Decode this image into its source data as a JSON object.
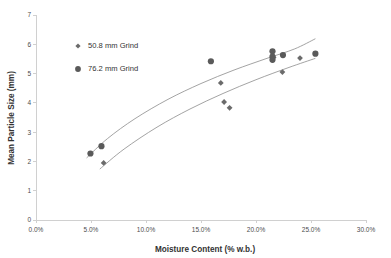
{
  "chart_data": {
    "type": "scatter",
    "title": "",
    "xlabel": "Moisture Content (% w.b.)",
    "ylabel": "Mean Particle Size (mm)",
    "xlim": [
      0,
      30
    ],
    "ylim": [
      0,
      7
    ],
    "xtick_labels": [
      "0.0%",
      "5.0%",
      "10.0%",
      "15.0%",
      "20.0%",
      "25.0%",
      "30.0%"
    ],
    "xtick_values": [
      0,
      5,
      10,
      15,
      20,
      25,
      30
    ],
    "ytick_labels": [
      "0",
      "1",
      "2",
      "3",
      "4",
      "5",
      "6",
      "7"
    ],
    "ytick_values": [
      0,
      1,
      2,
      3,
      4,
      5,
      6,
      7
    ],
    "grid": false,
    "legend_position": "upper-left",
    "marker_color": "#5a5a5a",
    "trendline_color": "#8c8c8c",
    "axis_color": "#d0d0d0",
    "series": [
      {
        "name": "50.8 mm Grind",
        "marker": "diamond",
        "points": [
          {
            "x": 6.15,
            "y": 1.95
          },
          {
            "x": 16.8,
            "y": 4.68
          },
          {
            "x": 17.1,
            "y": 4.03
          },
          {
            "x": 17.6,
            "y": 3.83
          },
          {
            "x": 21.6,
            "y": 5.55
          },
          {
            "x": 22.4,
            "y": 5.05
          },
          {
            "x": 24.0,
            "y": 5.53
          }
        ],
        "trendline": [
          {
            "x": 5.8,
            "y": 1.74
          },
          {
            "x": 8.0,
            "y": 2.42
          },
          {
            "x": 11.0,
            "y": 3.17
          },
          {
            "x": 14.0,
            "y": 3.79
          },
          {
            "x": 17.0,
            "y": 4.32
          },
          {
            "x": 20.0,
            "y": 4.79
          },
          {
            "x": 23.0,
            "y": 5.21
          },
          {
            "x": 25.4,
            "y": 5.52
          }
        ]
      },
      {
        "name": "76.2 mm Grind",
        "marker": "circle",
        "points": [
          {
            "x": 4.95,
            "y": 2.27
          },
          {
            "x": 5.95,
            "y": 2.52
          },
          {
            "x": 15.9,
            "y": 5.42
          },
          {
            "x": 21.5,
            "y": 5.76
          },
          {
            "x": 21.5,
            "y": 5.58
          },
          {
            "x": 21.5,
            "y": 5.47
          },
          {
            "x": 22.45,
            "y": 5.63
          },
          {
            "x": 25.4,
            "y": 5.68
          }
        ],
        "trendline": [
          {
            "x": 4.6,
            "y": 2.12
          },
          {
            "x": 6.5,
            "y": 2.78
          },
          {
            "x": 9.0,
            "y": 3.46
          },
          {
            "x": 12.0,
            "y": 4.12
          },
          {
            "x": 15.0,
            "y": 4.66
          },
          {
            "x": 18.0,
            "y": 5.12
          },
          {
            "x": 21.0,
            "y": 5.52
          },
          {
            "x": 23.5,
            "y": 5.84
          },
          {
            "x": 25.4,
            "y": 6.19
          }
        ]
      }
    ]
  },
  "legend": {
    "entries": [
      {
        "label": "50.8 mm Grind",
        "marker": "diamond"
      },
      {
        "label": "76.2 mm Grind",
        "marker": "circle"
      }
    ]
  }
}
